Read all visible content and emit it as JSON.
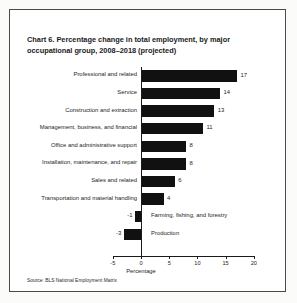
{
  "figure": {
    "title_line1": "Chart 6. Percentage change in total employment, by major",
    "title_line2": "occupational group, 2008–2018 (projected)",
    "title_prefix": "Chart 6.",
    "source": "Source: BLS National Employment Matrix"
  },
  "chart_data": {
    "type": "bar",
    "orientation": "horizontal",
    "title": "Chart 6. Percentage change in total employment, by major occupational group, 2008–2018 (projected)",
    "xlabel": "Percentage",
    "ylabel": "",
    "xlim": [
      -5,
      20
    ],
    "xticks": [
      -5,
      0,
      5,
      10,
      15,
      20
    ],
    "xtick_labels": [
      "-5",
      "0",
      "5",
      "10",
      "15",
      "20"
    ],
    "grid": false,
    "legend": false,
    "bar_color": "#111111",
    "categories": [
      "Professional and related",
      "Service",
      "Construction and extraction",
      "Management, business, and financial",
      "Office and administrative support",
      "Installation, maintenance, and repair",
      "Sales and related",
      "Transportation and material handling",
      "Farming, fishing, and forestry",
      "Production"
    ],
    "values": [
      17,
      14,
      13,
      11,
      8,
      8,
      6,
      4,
      -1,
      -3
    ],
    "value_labels": [
      "17",
      "14",
      "13",
      "11",
      "8",
      "8",
      "6",
      "4",
      "-1",
      "-3"
    ],
    "source": "Source: BLS National Employment Matrix"
  }
}
